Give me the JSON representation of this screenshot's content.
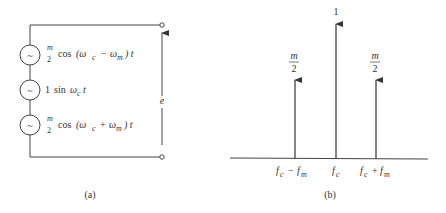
{
  "panel_a": {
    "caption": "(a)",
    "sources": [
      {
        "coef_num": "m",
        "coef_den": "2",
        "func": "cos",
        "arg_open": "(ω",
        "sub1": "c",
        "op": "−",
        "arg2": "ω",
        "sub2": "m",
        "close": ") t"
      },
      {
        "coef": "1",
        "func": "sin",
        "arg": "ω",
        "sub": "c",
        "tail": "t"
      },
      {
        "coef_num": "m",
        "coef_den": "2",
        "func": "cos",
        "arg_open": "(ω",
        "sub1": "c",
        "op": "+",
        "arg2": "ω",
        "sub2": "m",
        "close": ") t"
      }
    ],
    "source_symbol": "~",
    "output_label": "e"
  },
  "panel_b": {
    "caption": "(b)",
    "spectral_lines": [
      {
        "label_num": "m",
        "label_den": "2",
        "freq_main": "f",
        "freq_sub": "c",
        "op": "−",
        "freq2": "f",
        "freq2_sub": "m"
      },
      {
        "label": "1",
        "freq_main": "f",
        "freq_sub": "c"
      },
      {
        "label_num": "m",
        "label_den": "2",
        "freq_main": "f",
        "freq_sub": "c",
        "op": "+",
        "freq2": "f",
        "freq2_sub": "m"
      }
    ]
  },
  "colors": {
    "line": "#333333",
    "background": "#ffffff"
  }
}
